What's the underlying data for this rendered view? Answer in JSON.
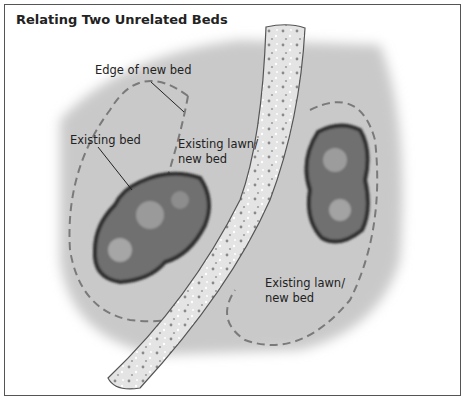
{
  "figure": {
    "title": "Relating Two Unrelated Beds",
    "labels": {
      "edge_of_new_bed": "Edge of new bed",
      "existing_bed": "Existing bed",
      "lawn_left_line1": "Existing lawn/",
      "lawn_left_line2": "new bed",
      "lawn_right_line1": "Existing lawn/",
      "lawn_right_line2": "new bed"
    },
    "colors": {
      "lawn": "#c4c4c4",
      "bed": "#6f6f6f",
      "bed_edge": "#2e2e2e",
      "path": "#e6e6e6",
      "dash": "#7a7a7a"
    }
  }
}
